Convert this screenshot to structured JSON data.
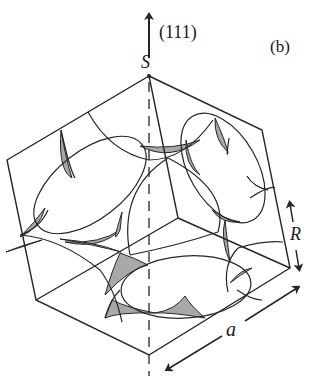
{
  "figure": {
    "panel_label": "(b)",
    "direction_label": "(111)",
    "vertex_label": "S",
    "dimension_labels": {
      "edge_length": "a",
      "radius": "R"
    }
  },
  "colors": {
    "line": "#262626",
    "shading": "#a8a8a8",
    "background": "#ffffff"
  }
}
